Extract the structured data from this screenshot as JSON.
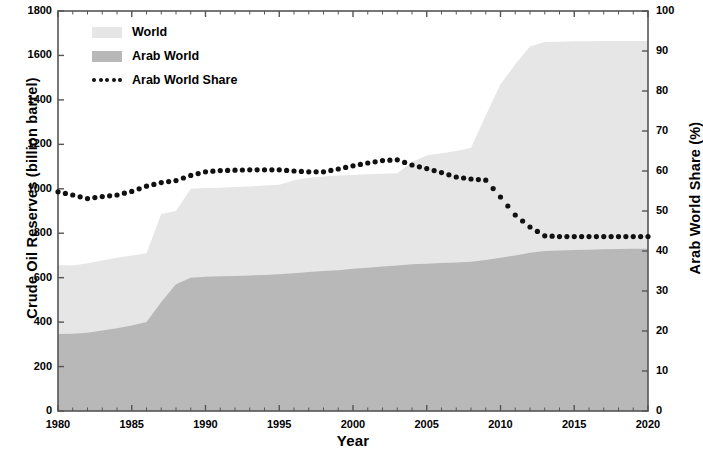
{
  "chart_data": {
    "type": "area",
    "title": "",
    "xlabel": "Year",
    "ylabel": "Crude Oil Reserves (billion barrel)",
    "ylabel_right": "Arab World Share (%)",
    "xlim": [
      1980,
      2020
    ],
    "ylim": [
      0,
      1800
    ],
    "ylim_right": [
      0,
      100
    ],
    "xticks": [
      1980,
      1985,
      1990,
      1995,
      2000,
      2005,
      2010,
      2015,
      2020
    ],
    "yticks": [
      0,
      200,
      400,
      600,
      800,
      1000,
      1200,
      1400,
      1600,
      1800
    ],
    "yticks_right": [
      0,
      10,
      20,
      30,
      40,
      50,
      60,
      70,
      80,
      90,
      100
    ],
    "minor_xticks": true,
    "grid": false,
    "legend_position": "top-left",
    "x": [
      1980,
      1981,
      1982,
      1983,
      1984,
      1985,
      1986,
      1987,
      1988,
      1989,
      1990,
      1991,
      1992,
      1993,
      1994,
      1995,
      1996,
      1997,
      1998,
      1999,
      2000,
      2001,
      2002,
      2003,
      2004,
      2005,
      2006,
      2007,
      2008,
      2009,
      2010,
      2011,
      2012,
      2013,
      2014,
      2015,
      2016,
      2017,
      2018,
      2019,
      2020
    ],
    "series": [
      {
        "name": "World",
        "type": "area",
        "color": "#e6e6e6",
        "axis": "left",
        "values": [
          657,
          655,
          665,
          677,
          690,
          700,
          710,
          887,
          900,
          1000,
          1003,
          1005,
          1008,
          1010,
          1015,
          1018,
          1038,
          1050,
          1055,
          1060,
          1062,
          1065,
          1068,
          1070,
          1120,
          1150,
          1160,
          1170,
          1185,
          1330,
          1470,
          1560,
          1640,
          1660,
          1662,
          1664,
          1664,
          1665,
          1665,
          1665,
          1665
        ]
      },
      {
        "name": "Arab World",
        "type": "area",
        "color": "#b8b8b8",
        "axis": "left",
        "values": [
          346,
          348,
          352,
          362,
          372,
          385,
          400,
          490,
          570,
          600,
          604,
          606,
          608,
          610,
          612,
          615,
          620,
          625,
          630,
          633,
          640,
          645,
          650,
          655,
          660,
          663,
          666,
          668,
          672,
          680,
          690,
          700,
          712,
          720,
          722,
          724,
          726,
          728,
          729,
          730,
          730
        ]
      },
      {
        "name": "Arab World Share",
        "type": "line",
        "marker": "dotted",
        "color": "#111111",
        "axis": "right",
        "values": [
          54.8,
          54.0,
          53.1,
          53.6,
          54.0,
          54.9,
          56.2,
          57.1,
          57.6,
          58.9,
          59.8,
          60.1,
          60.2,
          60.3,
          60.3,
          60.3,
          60.0,
          59.8,
          59.8,
          60.5,
          61.3,
          62.0,
          62.6,
          62.8,
          61.5,
          60.6,
          59.6,
          58.5,
          58.0,
          57.7,
          53.5,
          49.0,
          46.0,
          43.8,
          43.6,
          43.6,
          43.6,
          43.6,
          43.6,
          43.6,
          43.6
        ]
      }
    ]
  },
  "legend": {
    "items": [
      {
        "label": "World",
        "kind": "swatch",
        "color": "#e6e6e6"
      },
      {
        "label": "Arab World",
        "kind": "swatch",
        "color": "#b8b8b8"
      },
      {
        "label": "Arab World Share",
        "kind": "dots",
        "color": "#111111"
      }
    ]
  },
  "axes": {
    "left_title": "Crude Oil Reserves (billion barrel)",
    "right_title": "Arab World Share (%)",
    "bottom_title": "Year",
    "left_ticks": [
      "1800",
      "1600",
      "1400",
      "1200",
      "1000",
      "800",
      "600",
      "400",
      "200",
      "0"
    ],
    "right_ticks": [
      "100",
      "90",
      "80",
      "70",
      "60",
      "50",
      "40",
      "30",
      "20",
      "10",
      "0"
    ],
    "bottom_ticks": [
      "1980",
      "1985",
      "1990",
      "1995",
      "2000",
      "2005",
      "2010",
      "2015",
      "2020"
    ]
  },
  "colors": {
    "world_area": "#e6e6e6",
    "arab_area": "#b8b8b8",
    "share_line": "#111111",
    "axis": "#555555",
    "background": "#ffffff"
  }
}
